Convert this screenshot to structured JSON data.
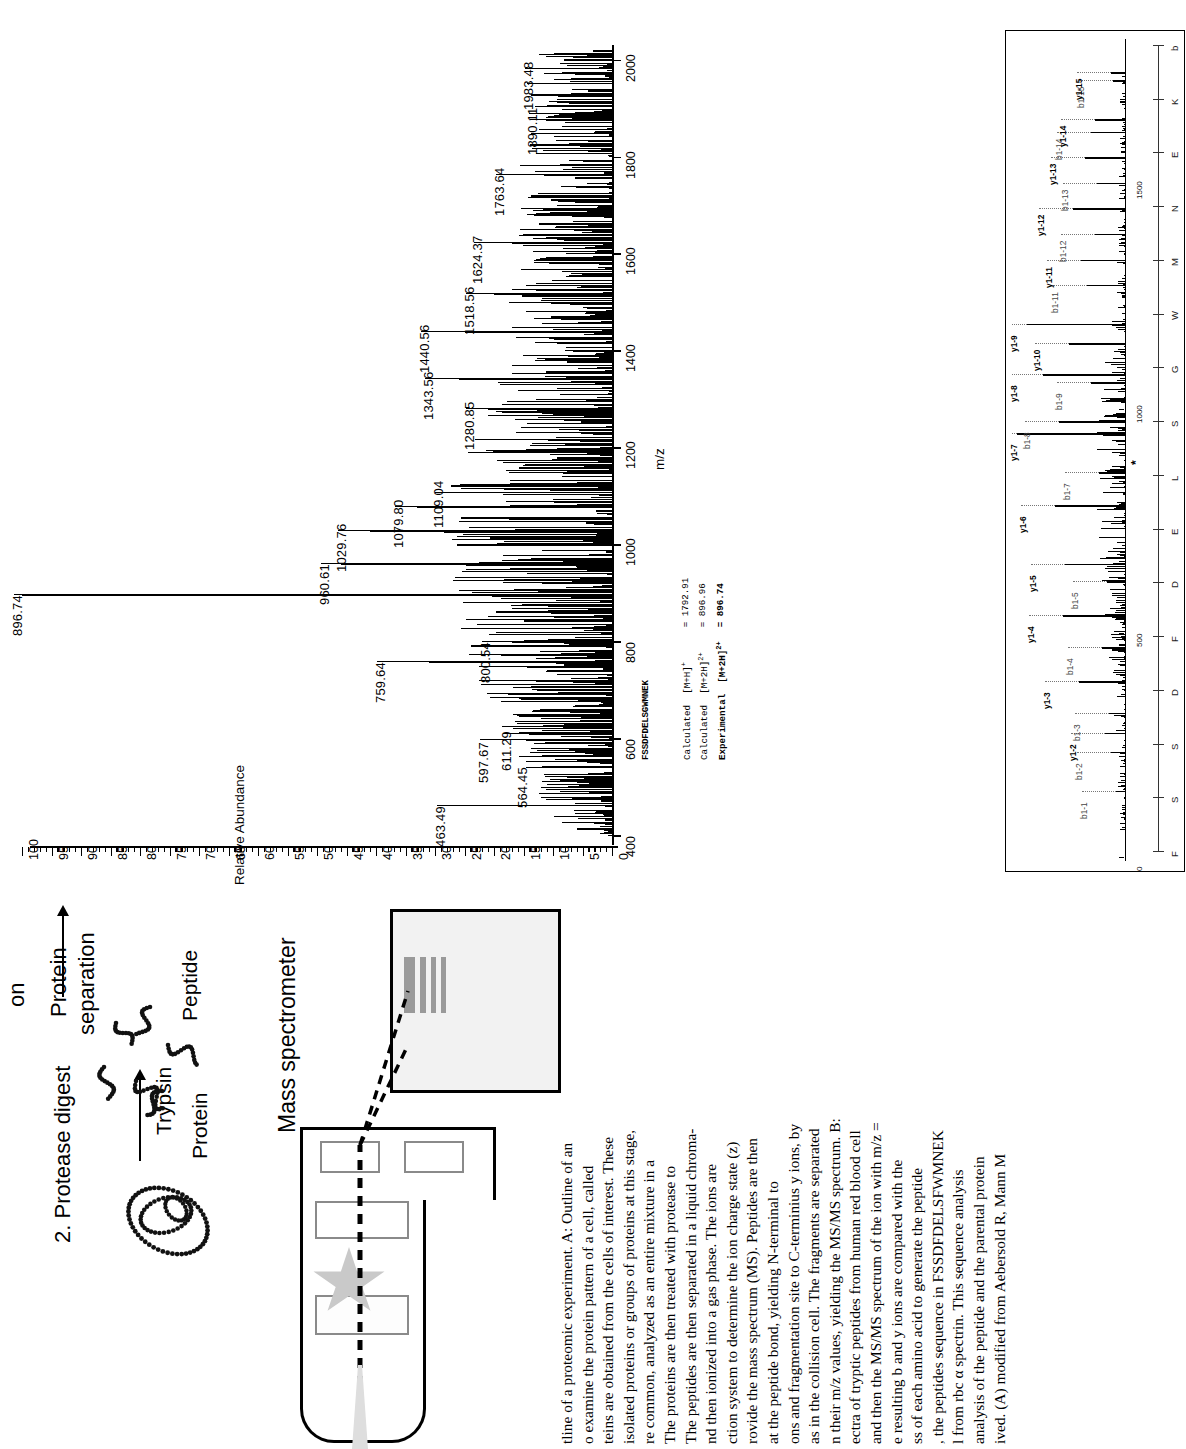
{
  "figure": {
    "panel_a": {
      "ylabel": "Relative Abundance",
      "xlabel": "m/z",
      "y_ticks": [
        0,
        5,
        10,
        15,
        20,
        25,
        30,
        35,
        40,
        45,
        50,
        55,
        60,
        65,
        70,
        75,
        80,
        85,
        90,
        95,
        100
      ],
      "x_ticks": [
        400,
        600,
        800,
        1000,
        1200,
        1400,
        1600,
        1800,
        2000
      ],
      "xlim": [
        380,
        2030
      ],
      "ylim": [
        0,
        100
      ],
      "peak_labels": [
        "463.49",
        "564.45",
        "597.67",
        "611.29",
        "759.64",
        "800.54",
        "896.74",
        "960.61",
        "1029.76",
        "1079.80",
        "1109.04",
        "1280.85",
        "1343.56",
        "1440.56",
        "1518.56",
        "1624.37",
        "1763.64",
        "1890.11",
        "1983.48"
      ]
    },
    "info_block": {
      "peptide": "FSSDFDELSGWMNEK",
      "rows": [
        {
          "label": "Calculated",
          "ion": "[M+H]",
          "charge": "+",
          "eq": "=",
          "value": "1792.91",
          "bold": false
        },
        {
          "label": "Calculated",
          "ion": "[M+2H]",
          "charge": "2+",
          "eq": "=",
          "value": "896.96",
          "bold": false
        },
        {
          "label": "Experimental",
          "ion": "[M+2H]",
          "charge": "2+",
          "eq": "=",
          "value": "896.74",
          "bold": true
        }
      ]
    },
    "panel_b": {
      "x_ticks": [
        0,
        500,
        1000,
        1500
      ],
      "xlim": [
        0,
        1800
      ],
      "sequence": [
        "F",
        "S",
        "S",
        "D",
        "F",
        "D",
        "E",
        "L",
        "S",
        "G",
        "W",
        "M",
        "N",
        "E",
        "K",
        "b"
      ],
      "precursor_marker": "*",
      "y_ions": [
        "y1-2",
        "y1-3",
        "y1-4",
        "y1-5",
        "y1-6",
        "y1-7",
        "y1-8",
        "y1-9",
        "y1-10",
        "y1-11",
        "y1-12",
        "y1-13",
        "y1-14",
        "y1-15"
      ],
      "b_ions": [
        "b1-1",
        "b1-2",
        "b1-3",
        "b1-4",
        "b1-5",
        "b1-7",
        "b1-8",
        "b1-9",
        "b1-11",
        "b1-12",
        "b1-13",
        "b1-14",
        "b1-15"
      ]
    },
    "schematic": {
      "step1_line1": "Protein",
      "step1_line2": "separation",
      "step2": "2. Protease digest",
      "protein_label": "Protein",
      "peptide_label": "Peptide",
      "trypsin_label": "Trypsin",
      "ms_label": "Mass spectrometer",
      "measurement_label": "surement",
      "top_cut_label": "on"
    },
    "caption": {
      "lines": [
        "tline of a proteomic experiment. A: Outline of an",
        "o examine the protein pattern of a cell, called",
        "teins are obtained from the cells of interest. These",
        "isolated proteins or groups of proteins at this stage,",
        "re common, analyzed as an entire mixture in a",
        "The proteins are then treated with protease to",
        "The peptides are then separated in a liquid chroma-",
        "nd then ionized into a gas phase. The ions are",
        "ction system to determine the ion charge state (z)",
        "rovide the mass spectrum (MS). Peptides are then",
        "at the peptide bond, yielding N-terminal to",
        "ons and fragmentation site to C-terminius y ions, by",
        "as in the collision cell. The fragments are separated",
        "n their m/z values, yielding the MS/MS spectrum. B:",
        "ectra of tryptic peptides from human red blood cell",
        "and then the MS/MS spectrum of the ion with m/z =",
        "e resulting b and y ions are compared with the",
        "ss of each amino acid to generate the peptide",
        ", the peptides sequence in FSSDFDELSFWMNEK",
        "l from rbc α spectrin. This sequence analysis",
        "analysis of the peptide and the parental protein",
        "ived. (A) modified from Aebersold R, Mann M"
      ]
    }
  }
}
